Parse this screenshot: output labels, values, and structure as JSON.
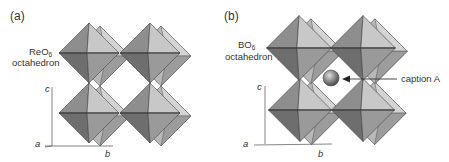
{
  "panels": [
    {
      "id": "a",
      "label": "(a)",
      "octahedron_label_line1": "ReO",
      "octahedron_label_sub": "6",
      "octahedron_label_line2": "octahedron",
      "axes": {
        "a": "a",
        "b": "b",
        "c": "c"
      },
      "has_a_site": false
    },
    {
      "id": "b",
      "label": "(b)",
      "octahedron_label_line1": "BO",
      "octahedron_label_sub": "6",
      "octahedron_label_line2": "octahedron",
      "axes": {
        "a": "a",
        "b": "b",
        "c": "c"
      },
      "has_a_site": true,
      "a_site_caption": "caption A"
    }
  ],
  "colors": {
    "face_light": "#c9c9c9",
    "face_mid": "#9a9a9a",
    "face_dark": "#7a7a7a",
    "face_darker": "#6a6a6a",
    "back_face": "#b3b3b3",
    "edge": "#444444",
    "axis": "#555555",
    "sphere": "#8a8a8a"
  }
}
